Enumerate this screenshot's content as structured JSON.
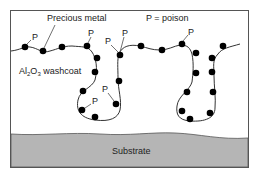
{
  "diagram": {
    "labels": {
      "precious_metal": "Precious metal",
      "poison_legend": "P = poison",
      "washcoat_prefix": "Al",
      "washcoat_sub1": "2",
      "washcoat_mid": "O",
      "washcoat_sub2": "3",
      "washcoat_suffix": " washcoat",
      "substrate": "Substrate",
      "poison_marker": "P"
    },
    "colors": {
      "frame": "#555555",
      "substrate_fill": "#b5b5b5",
      "particle": "#000000",
      "line": "#333333"
    }
  }
}
